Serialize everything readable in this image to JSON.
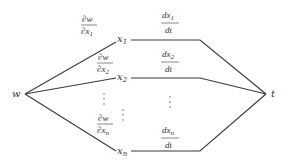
{
  "diagram": {
    "root": {
      "label": "w"
    },
    "terminal": {
      "label": "t"
    },
    "branches": [
      {
        "var": "x",
        "sub": "1",
        "partial": {
          "num": "∂w",
          "den_var": "∂x",
          "den_sub": "1"
        },
        "deriv": {
          "num_var": "dx",
          "num_sub": "1",
          "den": "dt"
        }
      },
      {
        "var": "x",
        "sub": "2",
        "partial": {
          "num": "∂w",
          "den_var": "∂x",
          "den_sub": "2"
        },
        "deriv": {
          "num_var": "dx",
          "num_sub": "2",
          "den": "dt"
        }
      },
      {
        "var": "x",
        "sub": "n",
        "partial": {
          "num": "∂w",
          "den_var": "∂x",
          "den_sub": "n"
        },
        "deriv": {
          "num_var": "dx",
          "num_sub": "n",
          "den": "dt"
        }
      }
    ],
    "ellipsis": "⋮"
  }
}
